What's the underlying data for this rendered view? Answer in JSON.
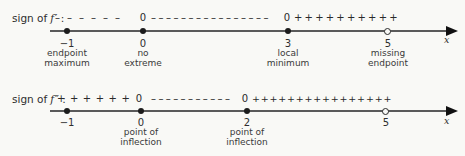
{
  "figure": {
    "background_color": "#f9f9f6",
    "line_color": "#5a5a5a",
    "point_color": "#1c1c1c"
  },
  "lines": [
    {
      "id": "sign-of-f-prime",
      "label_prefix": "sign of",
      "label_func": "f",
      "label_mark": "′ :",
      "sign_segments": [
        {
          "text": "––––––",
          "meaning": "negative"
        },
        {
          "text": "0",
          "meaning": "zero"
        },
        {
          "text": "––––––––––––––––",
          "meaning": "negative"
        },
        {
          "text": "0",
          "meaning": "zero"
        },
        {
          "text": "++++++++++",
          "meaning": "positive"
        }
      ],
      "points": [
        {
          "value": "−1",
          "type": "filled",
          "caption_line1": "endpoint",
          "caption_line2": "maximum"
        },
        {
          "value": "0",
          "type": "filled",
          "caption_line1": "no",
          "caption_line2": "extreme"
        },
        {
          "value": "3",
          "type": "filled",
          "caption_line1": "local",
          "caption_line2": "minimum"
        },
        {
          "value": "5",
          "type": "open",
          "caption_line1": "missing",
          "caption_line2": "endpoint"
        }
      ],
      "axis_label": "x"
    },
    {
      "id": "sign-of-f-double-prime",
      "label_prefix": "sign of",
      "label_func": "f",
      "label_mark": "″ :",
      "sign_segments": [
        {
          "text": "++++++",
          "meaning": "positive"
        },
        {
          "text": "0",
          "meaning": "zero"
        },
        {
          "text": "–––––––––––",
          "meaning": "negative"
        },
        {
          "text": "0",
          "meaning": "zero"
        },
        {
          "text": "++++++++++++++++",
          "meaning": "positive"
        }
      ],
      "points": [
        {
          "value": "−1",
          "type": "filled",
          "caption_line1": "",
          "caption_line2": ""
        },
        {
          "value": "0",
          "type": "filled",
          "caption_line1": "point of",
          "caption_line2": "inflection"
        },
        {
          "value": "2",
          "type": "filled",
          "caption_line1": "point of",
          "caption_line2": "inflection"
        },
        {
          "value": "5",
          "type": "open",
          "caption_line1": "",
          "caption_line2": ""
        }
      ],
      "axis_label": "x"
    }
  ]
}
